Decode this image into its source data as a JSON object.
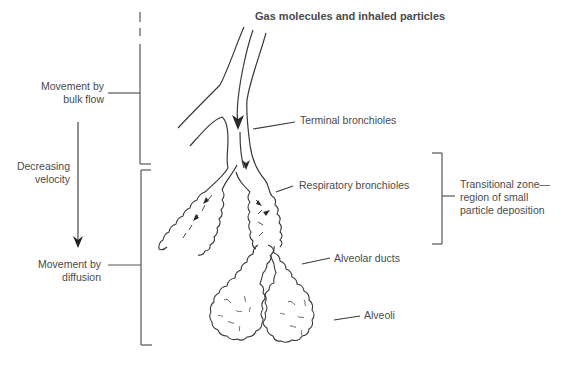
{
  "diagram": {
    "title": "Gas molecules and inhaled particles",
    "left_labels": {
      "bulk_flow": {
        "line1": "Movement by",
        "line2": "bulk flow"
      },
      "velocity": {
        "line1": "Decreasing",
        "line2": "velocity"
      },
      "diffusion": {
        "line1": "Movement by",
        "line2": "diffusion"
      }
    },
    "right_labels": {
      "terminal_bronchioles": "Terminal bronchioles",
      "respiratory_bronchioles": "Respiratory bronchioles",
      "alveolar_ducts": "Alveolar ducts",
      "alveoli": "Alveoli"
    },
    "transitional_zone": {
      "line1": "Transitional zone—",
      "line2": "region of small",
      "line3": "particle deposition"
    },
    "colors": {
      "line": "#4a4a4a",
      "text": "#4a4a4a",
      "background": "#ffffff"
    }
  }
}
